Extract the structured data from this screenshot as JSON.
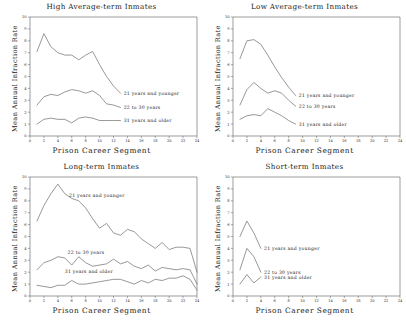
{
  "figure": {
    "xlabel": "Prison Career Segment",
    "ylabel": "Mean Annual Infraction Rate",
    "legend_labels": {
      "young": "21 years and younger",
      "mid": "22 to 30 years",
      "old": "31 years and older"
    },
    "line_color": "#6b6b6b",
    "axis_color": "#5a5a5a"
  },
  "chart_data": [
    {
      "type": "line",
      "panel": "top-left",
      "title": "High Average-term Inmates",
      "xlabel": "Prison Career Segment",
      "ylabel": "Mean Annual Infraction Rate",
      "xlim": [
        0,
        24
      ],
      "ylim": [
        0,
        10
      ],
      "xticks": [
        0,
        2,
        4,
        6,
        8,
        10,
        12,
        14,
        16,
        18,
        20,
        22,
        24
      ],
      "yticks": [
        0,
        1,
        2,
        3,
        4,
        5,
        6,
        7,
        8,
        9,
        10
      ],
      "grid": false,
      "legend_position": "inline-right",
      "series": [
        {
          "name": "21 years and younger",
          "x": [
            1,
            2,
            3,
            4,
            5,
            6,
            7,
            8,
            9,
            10,
            11,
            12,
            13
          ],
          "values": [
            7.1,
            8.6,
            7.5,
            7.0,
            6.8,
            6.8,
            6.4,
            6.8,
            7.1,
            6.0,
            5.0,
            4.2,
            3.6
          ]
        },
        {
          "name": "22 to 30 years",
          "x": [
            1,
            2,
            3,
            4,
            5,
            6,
            7,
            8,
            9,
            10,
            11,
            12,
            13
          ],
          "values": [
            2.6,
            3.3,
            3.5,
            3.4,
            3.7,
            3.9,
            3.8,
            3.6,
            3.8,
            3.4,
            2.7,
            2.6,
            2.4
          ]
        },
        {
          "name": "31 years and older",
          "x": [
            1,
            2,
            3,
            4,
            5,
            6,
            7,
            8,
            9,
            10,
            11,
            12,
            13
          ],
          "values": [
            1.0,
            1.4,
            1.5,
            1.4,
            1.4,
            1.1,
            1.5,
            1.6,
            1.5,
            1.3,
            1.3,
            1.3,
            1.3
          ]
        }
      ]
    },
    {
      "type": "line",
      "panel": "top-right",
      "title": "Low Average-term Inmates",
      "xlabel": "Prison Career Segment",
      "ylabel": "Mean Annual Infraction Rate",
      "xlim": [
        0,
        24
      ],
      "ylim": [
        0,
        10
      ],
      "xticks": [
        0,
        2,
        4,
        6,
        8,
        10,
        12,
        14,
        16,
        18,
        20,
        22,
        24
      ],
      "yticks": [
        0,
        1,
        2,
        3,
        4,
        5,
        6,
        7,
        8,
        9,
        10
      ],
      "grid": false,
      "legend_position": "inline-right",
      "series": [
        {
          "name": "21 years and younger",
          "x": [
            1,
            2,
            3,
            4,
            5,
            6,
            7,
            8,
            9
          ],
          "values": [
            6.5,
            8.0,
            8.1,
            7.7,
            6.8,
            5.8,
            4.9,
            4.1,
            3.4
          ]
        },
        {
          "name": "22 to 30 years",
          "x": [
            1,
            2,
            3,
            4,
            5,
            6,
            7,
            8,
            9
          ],
          "values": [
            2.6,
            3.9,
            4.5,
            4.0,
            3.6,
            3.8,
            3.6,
            3.0,
            2.5
          ]
        },
        {
          "name": "31 years and older",
          "x": [
            1,
            2,
            3,
            4,
            5,
            6,
            7,
            8,
            9
          ],
          "values": [
            1.4,
            1.7,
            1.8,
            1.7,
            2.3,
            2.0,
            1.7,
            1.3,
            1.0
          ]
        }
      ]
    },
    {
      "type": "line",
      "panel": "bottom-left",
      "title": "Long-term Inmates",
      "xlabel": "Prison Career Segment",
      "ylabel": "Mean Annual Infraction Rate",
      "xlim": [
        0,
        24
      ],
      "ylim": [
        0,
        10
      ],
      "xticks": [
        0,
        2,
        4,
        6,
        8,
        10,
        12,
        14,
        16,
        18,
        20,
        22,
        24
      ],
      "yticks": [
        0,
        1,
        2,
        3,
        4,
        5,
        6,
        7,
        8,
        9,
        10
      ],
      "grid": false,
      "legend_position": "inline-center",
      "series": [
        {
          "name": "21 years and younger",
          "x": [
            1,
            2,
            3,
            4,
            5,
            6,
            7,
            8,
            9,
            10,
            11,
            12,
            13,
            14,
            15,
            16,
            17,
            18,
            19,
            20,
            21,
            22,
            23,
            24
          ],
          "values": [
            6.3,
            7.6,
            8.6,
            9.4,
            8.6,
            8.2,
            8.0,
            7.4,
            6.5,
            5.7,
            6.1,
            5.3,
            5.1,
            5.6,
            5.4,
            4.8,
            4.4,
            4.0,
            4.5,
            3.9,
            4.1,
            4.1,
            4.0,
            2.0
          ]
        },
        {
          "name": "22 to 30 years",
          "x": [
            1,
            2,
            3,
            4,
            5,
            6,
            7,
            8,
            9,
            10,
            11,
            12,
            13,
            14,
            15,
            16,
            17,
            18,
            19,
            20,
            21,
            22,
            23,
            24
          ],
          "values": [
            2.2,
            2.8,
            3.0,
            3.3,
            3.2,
            2.6,
            3.3,
            2.8,
            2.5,
            2.6,
            2.7,
            3.1,
            2.7,
            2.9,
            2.5,
            2.3,
            2.6,
            2.1,
            2.4,
            2.3,
            2.2,
            2.3,
            2.2,
            1.0
          ]
        },
        {
          "name": "31 years and older",
          "x": [
            1,
            2,
            3,
            4,
            5,
            6,
            7,
            8,
            9,
            10,
            11,
            12,
            13,
            14,
            15,
            16,
            17,
            18,
            19,
            20,
            21,
            22,
            23,
            24
          ],
          "values": [
            0.9,
            0.8,
            0.7,
            0.9,
            0.9,
            1.3,
            1.0,
            1.0,
            1.1,
            1.2,
            1.3,
            1.4,
            1.4,
            1.2,
            1.0,
            1.3,
            1.1,
            1.4,
            1.3,
            1.5,
            1.5,
            1.7,
            1.4,
            0.5
          ]
        }
      ]
    },
    {
      "type": "line",
      "panel": "bottom-right",
      "title": "Short-term Inmates",
      "xlabel": "Prison Career Segment",
      "ylabel": "Mean Annual Infraction Rate",
      "xlim": [
        0,
        24
      ],
      "ylim": [
        0,
        10
      ],
      "xticks": [
        0,
        2,
        4,
        6,
        8,
        10,
        12,
        14,
        16,
        18,
        20,
        22,
        24
      ],
      "yticks": [
        0,
        1,
        2,
        3,
        4,
        5,
        6,
        7,
        8,
        9,
        10
      ],
      "grid": false,
      "legend_position": "inline-right",
      "series": [
        {
          "name": "21 years and younger",
          "x": [
            1,
            2,
            3,
            4
          ],
          "values": [
            5.0,
            6.3,
            5.3,
            4.0
          ]
        },
        {
          "name": "22 to 30 years",
          "x": [
            1,
            2,
            3,
            4
          ],
          "values": [
            2.2,
            4.0,
            3.3,
            2.0
          ]
        },
        {
          "name": "31 years and older",
          "x": [
            1,
            2,
            3,
            4
          ],
          "values": [
            1.0,
            1.8,
            1.1,
            1.6
          ]
        }
      ]
    }
  ]
}
